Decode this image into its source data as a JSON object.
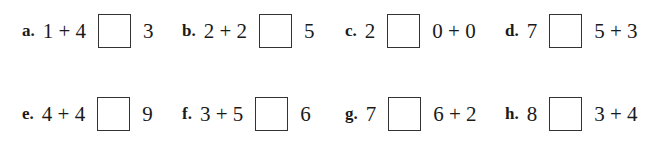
{
  "worksheet": {
    "problems": [
      {
        "label": "a.",
        "left": "1 + 4",
        "right": "3"
      },
      {
        "label": "b.",
        "left": "2 + 2",
        "right": "5"
      },
      {
        "label": "c.",
        "left": "2",
        "right": "0 + 0"
      },
      {
        "label": "d.",
        "left": "7",
        "right": "5 + 3"
      },
      {
        "label": "e.",
        "left": "4 + 4",
        "right": "9"
      },
      {
        "label": "f.",
        "left": "3 + 5",
        "right": "6"
      },
      {
        "label": "g.",
        "left": "7",
        "right": "6 + 2"
      },
      {
        "label": "h.",
        "left": "8",
        "right": "3 + 4"
      }
    ]
  }
}
